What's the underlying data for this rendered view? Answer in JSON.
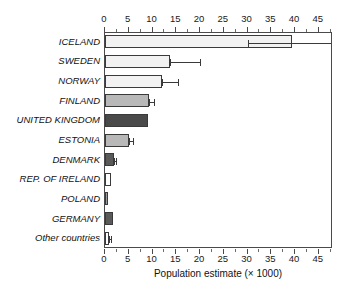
{
  "chart_data": {
    "type": "bar",
    "orientation": "horizontal",
    "title": "",
    "xlabel": "Population estimate (× 1000)",
    "ylabel": "",
    "xlim": [
      0,
      48
    ],
    "grid": false,
    "legend": "none",
    "axis_positions": [
      "top",
      "bottom"
    ],
    "tick_step_major": 5,
    "tick_step_minor": 2.5,
    "tick_labels": [
      "0",
      "5",
      "10",
      "15",
      "20",
      "25",
      "30",
      "35",
      "40",
      "45"
    ],
    "tick_values": [
      0,
      5,
      10,
      15,
      20,
      25,
      30,
      35,
      40,
      45
    ],
    "categories": [
      "ICELAND",
      "SWEDEN",
      "NORWAY",
      "FINLAND",
      "UNITED KINGDOM",
      "ESTONIA",
      "DENMARK",
      "REP. OF IRELAND",
      "POLAND",
      "GERMANY",
      "Other countries"
    ],
    "values": [
      39.3,
      13.7,
      12.1,
      9.3,
      9.1,
      5.1,
      1.9,
      1.2,
      0.7,
      1.6,
      0.9
    ],
    "error_low": [
      30.0,
      13.7,
      12.1,
      9.3,
      null,
      5.1,
      1.9,
      null,
      null,
      null,
      0.9
    ],
    "error_high": [
      48.0,
      20.0,
      15.3,
      10.3,
      null,
      5.8,
      2.4,
      null,
      null,
      null,
      1.2
    ],
    "fills": [
      "#f2f2f2",
      "#f2f2f2",
      "#f2f2f2",
      "#b8b8b8",
      "#4a4a4a",
      "#b8b8b8",
      "#5a5a5a",
      "#ffffff",
      "#9a9a9a",
      "#5a5a5a",
      "#ffffff"
    ],
    "bar_edge_color": "#3a3a3a",
    "axis_color": "#4a4a4a",
    "text_color": "#111111",
    "background": "#ffffff"
  }
}
